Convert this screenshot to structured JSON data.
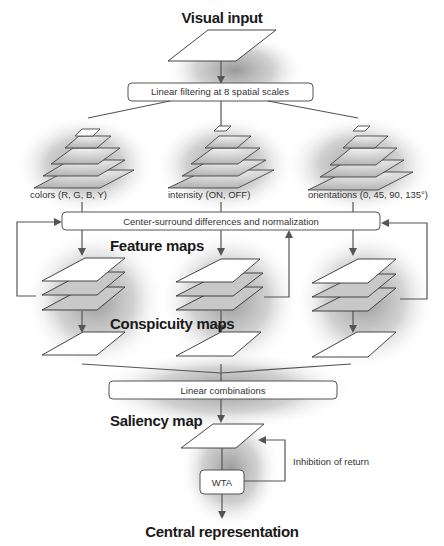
{
  "diagram": {
    "title_top": "Visual input",
    "stage1_box": "Linear filtering at 8 spatial scales",
    "channels": [
      {
        "label": "colors (R, G, B, Y)"
      },
      {
        "label": "intensity  (ON, OFF)"
      },
      {
        "label": "orientations  (0, 45, 90, 135°)"
      }
    ],
    "stage2_box": "Center-surround differences and normalization",
    "feature_maps_title": "Feature maps",
    "conspicuity_maps_title": "Conspicuity maps",
    "stage3_box": "Linear combinations",
    "saliency_map_title": "Saliency map",
    "wta_box": "WTA",
    "inhibition_label": "Inhibition of return",
    "title_bottom": "Central representation"
  }
}
